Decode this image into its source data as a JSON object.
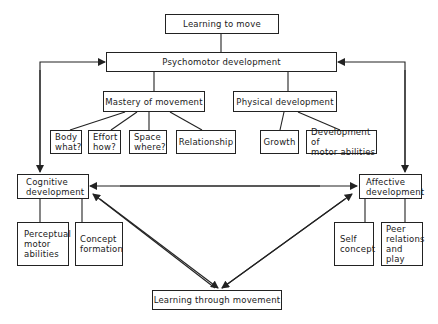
{
  "diagram": {
    "nodes": {
      "learning_to_move": "Learning to move",
      "psychomotor": "Psychomotor development",
      "mastery": "Mastery of movement",
      "physical": "Physical development",
      "body": "Body\nwhat?",
      "effort": "Effort\nhow?",
      "space": "Space\nwhere?",
      "relationship": "Relationship",
      "growth": "Growth",
      "motor_abilities": "Development of\nmotor abilities",
      "cognitive": "Cognitive\ndevelopment",
      "affective": "Affective\ndevelopment",
      "perceptual": "Perceptual\nmotor\nabilities",
      "concept_formation": "Concept\nformation",
      "self_concept": "Self\nconcept",
      "peer": "Peer\nrelations\nand\nplay",
      "learning_through": "Learning through movement"
    },
    "edges": [
      {
        "from": "learning_to_move",
        "to": "psychomotor",
        "type": "line"
      },
      {
        "from": "psychomotor",
        "to": "mastery",
        "type": "line"
      },
      {
        "from": "psychomotor",
        "to": "physical",
        "type": "line"
      },
      {
        "from": "mastery",
        "to": "body",
        "type": "line"
      },
      {
        "from": "mastery",
        "to": "effort",
        "type": "line"
      },
      {
        "from": "mastery",
        "to": "space",
        "type": "line"
      },
      {
        "from": "mastery",
        "to": "relationship",
        "type": "line"
      },
      {
        "from": "physical",
        "to": "growth",
        "type": "line"
      },
      {
        "from": "physical",
        "to": "motor_abilities",
        "type": "line"
      },
      {
        "from": "psychomotor",
        "to": "cognitive",
        "type": "bidirectional-arrow"
      },
      {
        "from": "psychomotor",
        "to": "affective",
        "type": "bidirectional-arrow"
      },
      {
        "from": "cognitive",
        "to": "affective",
        "type": "bidirectional-arrow"
      },
      {
        "from": "cognitive",
        "to": "perceptual",
        "type": "line"
      },
      {
        "from": "cognitive",
        "to": "concept_formation",
        "type": "line"
      },
      {
        "from": "affective",
        "to": "self_concept",
        "type": "line"
      },
      {
        "from": "affective",
        "to": "peer",
        "type": "line"
      },
      {
        "from": "learning_through",
        "to": "cognitive",
        "type": "bidirectional-arrow"
      },
      {
        "from": "learning_through",
        "to": "affective",
        "type": "bidirectional-arrow"
      }
    ]
  }
}
